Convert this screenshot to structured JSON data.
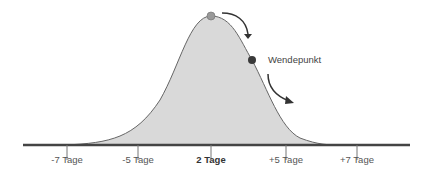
{
  "diagram": {
    "type": "bell-curve",
    "annotation": "Wendepunkt",
    "ticks": [
      {
        "label": "-7 Tage",
        "x": 67,
        "bold": false
      },
      {
        "label": "-5 Tage",
        "x": 138,
        "bold": false
      },
      {
        "label": "2 Tage",
        "x": 211,
        "bold": true
      },
      {
        "label": "+5 Tage",
        "x": 286,
        "bold": false
      },
      {
        "label": "+7 Tage",
        "x": 357,
        "bold": false
      }
    ],
    "colors": {
      "fill": "#d9d9d9",
      "curve": "#666666",
      "axis": "#444444",
      "peak_dot": "#999999",
      "inflection_dot": "#3a3a3a"
    }
  }
}
